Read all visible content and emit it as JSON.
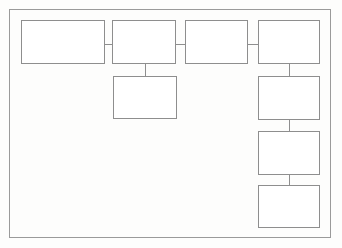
{
  "diagram": {
    "background_color": "#fdfdfc",
    "border_color": "#9a9a9a",
    "node_border_color": "#8e8e8e",
    "node_fill_color": "#ffffff",
    "connector_color": "#8e8e8e",
    "frame": {
      "name": "diagram-frame",
      "x": 9,
      "y": 9,
      "width": 322,
      "height": 229
    },
    "nodes": [
      {
        "name": "node-top-1",
        "label": "",
        "x": 21,
        "y": 20,
        "width": 84,
        "height": 44
      },
      {
        "name": "node-top-2",
        "label": "",
        "x": 112,
        "y": 20,
        "width": 64,
        "height": 44
      },
      {
        "name": "node-top-3",
        "label": "",
        "x": 185,
        "y": 20,
        "width": 63,
        "height": 44
      },
      {
        "name": "node-top-4",
        "label": "",
        "x": 258,
        "y": 20,
        "width": 62,
        "height": 44
      },
      {
        "name": "node-child-center",
        "label": "",
        "x": 113,
        "y": 76,
        "width": 64,
        "height": 43
      },
      {
        "name": "node-right-2",
        "label": "",
        "x": 258,
        "y": 76,
        "width": 62,
        "height": 44
      },
      {
        "name": "node-right-3",
        "label": "",
        "x": 258,
        "y": 131,
        "width": 62,
        "height": 44
      },
      {
        "name": "node-right-4",
        "label": "",
        "x": 258,
        "y": 185,
        "width": 62,
        "height": 43
      }
    ],
    "connectors": [
      {
        "name": "connector-top1-to-top2",
        "orientation": "h",
        "x": 105,
        "y": 44,
        "length": 7
      },
      {
        "name": "connector-top2-to-top3",
        "orientation": "h",
        "x": 176,
        "y": 44,
        "length": 9
      },
      {
        "name": "connector-top3-to-top4",
        "orientation": "h",
        "x": 248,
        "y": 44,
        "length": 10
      },
      {
        "name": "connector-top2-to-child",
        "orientation": "v",
        "x": 145,
        "y": 64,
        "length": 12
      },
      {
        "name": "connector-top4-to-right2",
        "orientation": "v",
        "x": 289,
        "y": 64,
        "length": 12
      },
      {
        "name": "connector-right2-to-right3",
        "orientation": "v",
        "x": 289,
        "y": 120,
        "length": 11
      },
      {
        "name": "connector-right3-to-right4",
        "orientation": "v",
        "x": 289,
        "y": 175,
        "length": 10
      }
    ]
  }
}
